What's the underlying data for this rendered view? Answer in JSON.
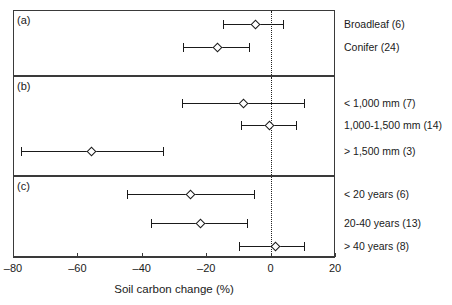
{
  "chart_data": {
    "type": "scatter",
    "title": "",
    "xlabel": "Soil carbon change (%)",
    "ylabel": "",
    "xlim": [
      -80,
      20
    ],
    "xticks": [
      -80,
      -60,
      -40,
      -20,
      0,
      20
    ],
    "xticklabels": [
      "–80",
      "–60",
      "–40",
      "–20",
      "0",
      "20"
    ],
    "grid": false,
    "legend_position": "none",
    "reference_line": {
      "x": 0,
      "style": "dotted"
    },
    "panels": [
      {
        "letter": "(a)",
        "rows": [
          {
            "label": "Broadleaf (6)",
            "value": -4.6,
            "low": -14.8,
            "high": 4.3
          },
          {
            "label": "Conifer (24)",
            "value": -16.6,
            "low": -27.1,
            "high": -6.5
          }
        ]
      },
      {
        "letter": "(b)",
        "rows": [
          {
            "label": "< 1,000 mm (7)",
            "value": -8.3,
            "low": -27.4,
            "high": 10.8
          },
          {
            "label": "1,000-1,500 mm (14)",
            "value": -0.3,
            "low": -9.2,
            "high": 8.3
          },
          {
            "label": "> 1,500 mm (3)",
            "value": -55.7,
            "low": -77.5,
            "high": -33.2
          }
        ]
      },
      {
        "letter": "(c)",
        "rows": [
          {
            "label": "< 20 years (6)",
            "value": -24.9,
            "low": -44.6,
            "high": -4.9
          },
          {
            "label": "20-40 years (13)",
            "value": -21.8,
            "low": -37.2,
            "high": -7.1
          },
          {
            "label": "> 40 years (8)",
            "value": 1.5,
            "low": -9.8,
            "high": 10.8
          }
        ]
      }
    ]
  },
  "colors": {
    "axis": "#3a3a3a",
    "marker_fill": "#ffffff",
    "marker_stroke": "#1a1a1a",
    "text": "#1a1a1a"
  }
}
